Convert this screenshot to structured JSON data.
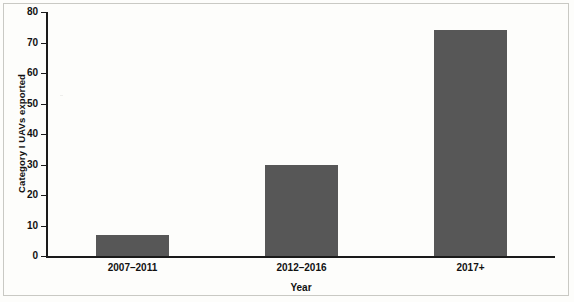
{
  "chart_data": {
    "type": "bar",
    "title": "",
    "xlabel": "Year",
    "ylabel": "Category I UAVs exported",
    "categories": [
      "2007–2011",
      "2012–2016",
      "2017+"
    ],
    "values": [
      7,
      30,
      74
    ],
    "ylim": [
      0,
      80
    ],
    "yticks": [
      0,
      10,
      20,
      30,
      40,
      50,
      60,
      70,
      80
    ],
    "ytick_labels": [
      "0",
      "10",
      "20",
      "30",
      "40",
      "50",
      "60",
      "70",
      "80"
    ],
    "grid": false,
    "legend": null,
    "bar_color": "#575757",
    "axis_color": "#1a1a1a",
    "background": "#fdfdfb"
  }
}
